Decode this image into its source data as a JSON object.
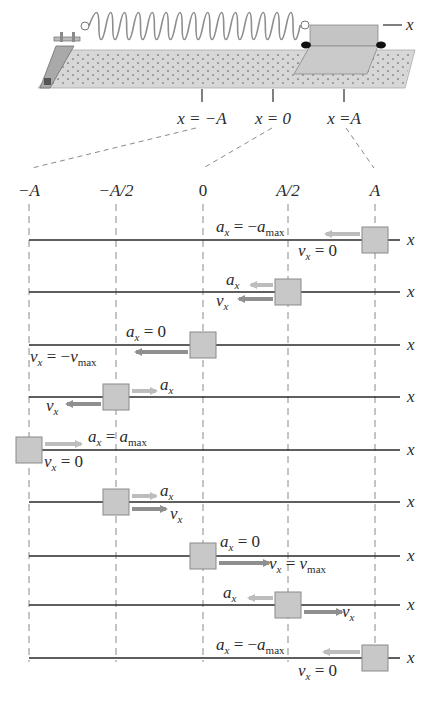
{
  "figure": {
    "colors": {
      "ink": "#2a2a2a",
      "block_fill": "#c8c8c8",
      "block_stroke": "#8a8a8a",
      "track_fill": "#d7d7d7",
      "track_dots": "#8c8c8c",
      "accel_arrow": "#bdbdbd",
      "vel_arrow": "#8f8f8f",
      "dash": "#8a8a8a"
    }
  },
  "apparatus": {
    "axis_label": "x",
    "position_labels": [
      {
        "text": "x = −A",
        "x": 202
      },
      {
        "text": "x = 0",
        "x": 273
      },
      {
        "text": "x =A",
        "x": 344
      }
    ]
  },
  "columns": [
    {
      "label": "−A",
      "x": 29
    },
    {
      "label": "−A/2",
      "x": 116
    },
    {
      "label": "0",
      "x": 203
    },
    {
      "label": "A/2",
      "x": 288
    },
    {
      "label": "A",
      "x": 375
    }
  ],
  "rows": [
    {
      "y": 240,
      "block_x": 375,
      "accel": {
        "dir": "left",
        "len": 34,
        "label_parts": [
          "a",
          "x",
          " = −a",
          "max"
        ],
        "label_x": 216,
        "label_y": 232
      },
      "vel": {
        "dir": "none",
        "label_parts": [
          "v",
          "x",
          " = 0",
          ""
        ],
        "label_x": 298,
        "label_y": 256
      }
    },
    {
      "y": 292,
      "block_x": 288,
      "accel": {
        "dir": "left",
        "len": 22,
        "label_parts": [
          "a",
          "x",
          "",
          ""
        ],
        "label_x": 226,
        "label_y": 285
      },
      "vel": {
        "dir": "left",
        "len": 34,
        "label_parts": [
          "v",
          "x",
          "",
          ""
        ],
        "label_x": 216,
        "label_y": 306
      }
    },
    {
      "y": 345,
      "block_x": 203,
      "accel": {
        "dir": "none",
        "label_parts": [
          "a",
          "x",
          " = 0",
          ""
        ],
        "label_x": 126,
        "label_y": 337
      },
      "vel": {
        "dir": "left",
        "len": 52,
        "label_parts": [
          "v",
          "x",
          " = −v",
          "max"
        ],
        "label_x": 30,
        "label_y": 362
      }
    },
    {
      "y": 397,
      "block_x": 116,
      "accel": {
        "dir": "right",
        "len": 24,
        "label_parts": [
          "a",
          "x",
          "",
          ""
        ],
        "label_x": 160,
        "label_y": 390
      },
      "vel": {
        "dir": "left",
        "len": 34,
        "label_parts": [
          "v",
          "x",
          "",
          ""
        ],
        "label_x": 46,
        "label_y": 411
      }
    },
    {
      "y": 450,
      "block_x": 29,
      "accel": {
        "dir": "right",
        "len": 36,
        "label_parts": [
          "a",
          "x",
          " = a",
          "max"
        ],
        "label_x": 88,
        "label_y": 442
      },
      "vel": {
        "dir": "none",
        "label_parts": [
          "v",
          "x",
          " = 0",
          ""
        ],
        "label_x": 44,
        "label_y": 467
      }
    },
    {
      "y": 502,
      "block_x": 116,
      "accel": {
        "dir": "right",
        "len": 24,
        "label_parts": [
          "a",
          "x",
          "",
          ""
        ],
        "label_x": 160,
        "label_y": 496
      },
      "vel": {
        "dir": "right",
        "len": 34,
        "label_parts": [
          "v",
          "x",
          "",
          ""
        ],
        "label_x": 170,
        "label_y": 519
      }
    },
    {
      "y": 556,
      "block_x": 203,
      "accel": {
        "dir": "none",
        "label_parts": [
          "a",
          "x",
          " = 0",
          ""
        ],
        "label_x": 220,
        "label_y": 547
      },
      "vel": {
        "dir": "right",
        "len": 50,
        "label_parts": [
          "v",
          "x",
          " = v",
          "max"
        ],
        "label_x": 269,
        "label_y": 569
      }
    },
    {
      "y": 605,
      "block_x": 288,
      "accel": {
        "dir": "left",
        "len": 24,
        "label_parts": [
          "a",
          "x",
          "",
          ""
        ],
        "label_x": 223,
        "label_y": 598
      },
      "vel": {
        "dir": "right",
        "len": 38,
        "label_parts": [
          "v",
          "x",
          "",
          ""
        ],
        "label_x": 342,
        "label_y": 617
      }
    },
    {
      "y": 658,
      "block_x": 375,
      "accel": {
        "dir": "left",
        "len": 36,
        "label_parts": [
          "a",
          "x",
          " = −a",
          "max"
        ],
        "label_x": 216,
        "label_y": 650
      },
      "vel": {
        "dir": "none",
        "label_parts": [
          "v",
          "x",
          " = 0",
          ""
        ],
        "label_x": 298,
        "label_y": 676
      }
    }
  ],
  "row_axis_label": "x"
}
